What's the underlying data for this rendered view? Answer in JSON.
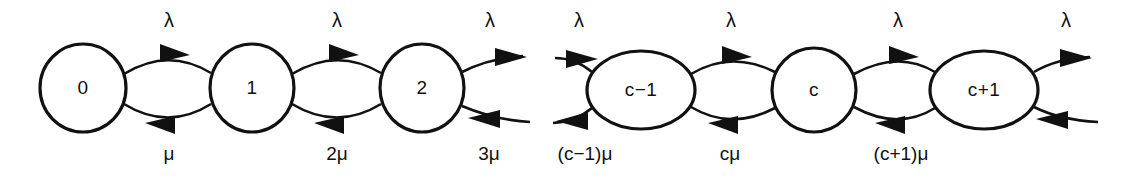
{
  "diagram": {
    "stroke_color": "#111111",
    "background_color": "#ffffff",
    "nodes": [
      {
        "id": "n0",
        "label": "0",
        "cx": 83,
        "cy": 88,
        "rx": 43,
        "ry": 44,
        "shape": "circle"
      },
      {
        "id": "n1",
        "label": "1",
        "cx": 252,
        "cy": 88,
        "rx": 42,
        "ry": 44,
        "shape": "circle"
      },
      {
        "id": "n2",
        "label": "2",
        "cx": 422,
        "cy": 88,
        "rx": 42,
        "ry": 44,
        "shape": "circle"
      },
      {
        "id": "ncm1",
        "label": "c−1",
        "cx": 641,
        "cy": 90,
        "rx": 54,
        "ry": 39,
        "shape": "ellipse"
      },
      {
        "id": "nc",
        "label": "c",
        "cx": 814,
        "cy": 90,
        "rx": 42,
        "ry": 42,
        "shape": "circle"
      },
      {
        "id": "ncp1",
        "label": "c+1",
        "cx": 984,
        "cy": 90,
        "rx": 54,
        "ry": 39,
        "shape": "ellipse"
      }
    ],
    "top_rate_labels": [
      {
        "text": "λ",
        "x": 169,
        "y": 22
      },
      {
        "text": "λ",
        "x": 337,
        "y": 22
      },
      {
        "text": "λ",
        "x": 490,
        "y": 22
      },
      {
        "text": "λ",
        "x": 579,
        "y": 22
      },
      {
        "text": "λ",
        "x": 731,
        "y": 22
      },
      {
        "text": "λ",
        "x": 898,
        "y": 22
      },
      {
        "text": "λ",
        "x": 1066,
        "y": 22
      }
    ],
    "bottom_rate_labels": [
      {
        "text": "μ",
        "x": 169,
        "y": 155
      },
      {
        "text": "2μ",
        "x": 337,
        "y": 155
      },
      {
        "text": "3μ",
        "x": 489,
        "y": 155
      },
      {
        "text": "(c−1)μ",
        "x": 585,
        "y": 155
      },
      {
        "text": "cμ",
        "x": 730,
        "y": 155
      },
      {
        "text": "(c+1)μ",
        "x": 901,
        "y": 155
      }
    ]
  }
}
